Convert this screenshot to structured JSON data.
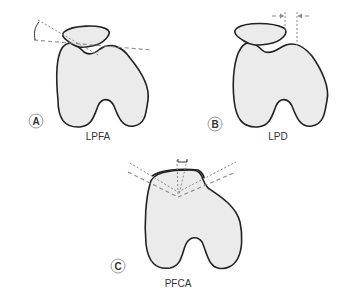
{
  "figure": {
    "panels": [
      {
        "id": "A",
        "letter": "A",
        "label": "LPFA"
      },
      {
        "id": "B",
        "letter": "B",
        "label": "LPD"
      },
      {
        "id": "C",
        "letter": "C",
        "label": "PFCA"
      }
    ]
  },
  "colors": {
    "bone_fill": "#ebebeb",
    "outline": "#222222",
    "guide_lines": "#8a8a8a"
  }
}
